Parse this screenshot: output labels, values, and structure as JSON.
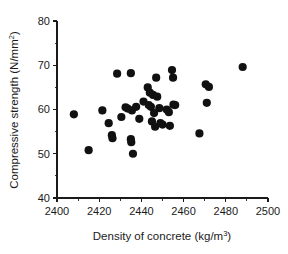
{
  "chart_data": {
    "type": "scatter",
    "title": "",
    "xlabel": "Density of concrete (kg/m3)",
    "xlabel_base": "Density of concrete (kg/m",
    "xlabel_sup": "3",
    "xlabel_tail": ")",
    "ylabel": "Compressive strength (N/mm2)",
    "ylabel_base": "Compressive strength (N/mm",
    "ylabel_sup": "2",
    "ylabel_tail": ")",
    "xlim": [
      2400,
      2500
    ],
    "ylim": [
      40,
      80
    ],
    "x_major_ticks": [
      2400,
      2420,
      2440,
      2460,
      2480,
      2500
    ],
    "x_minor_ticks": [
      2410,
      2430,
      2450,
      2470,
      2490
    ],
    "y_major_ticks": [
      40,
      50,
      60,
      70,
      80
    ],
    "y_minor_ticks": [
      45,
      55,
      65,
      75
    ],
    "x_tick_labels": [
      "2400",
      "2420",
      "2440",
      "2460",
      "2480",
      "2500"
    ],
    "y_tick_labels": [
      "40",
      "50",
      "60",
      "70",
      "80"
    ],
    "grid": false,
    "legend": false,
    "marker": "filled-circle",
    "marker_color": "#111111",
    "marker_size": 4.1,
    "points": [
      {
        "x": 2408.0,
        "y": 58.9
      },
      {
        "x": 2415.0,
        "y": 50.8
      },
      {
        "x": 2421.5,
        "y": 59.8
      },
      {
        "x": 2424.5,
        "y": 56.9
      },
      {
        "x": 2426.0,
        "y": 54.2
      },
      {
        "x": 2426.3,
        "y": 53.5
      },
      {
        "x": 2428.5,
        "y": 68.1
      },
      {
        "x": 2430.5,
        "y": 58.3
      },
      {
        "x": 2432.5,
        "y": 60.5
      },
      {
        "x": 2433.5,
        "y": 60.2
      },
      {
        "x": 2435.0,
        "y": 68.2
      },
      {
        "x": 2435.0,
        "y": 53.3
      },
      {
        "x": 2435.2,
        "y": 52.6
      },
      {
        "x": 2435.5,
        "y": 59.8
      },
      {
        "x": 2436.0,
        "y": 50.0
      },
      {
        "x": 2437.5,
        "y": 60.6
      },
      {
        "x": 2439.0,
        "y": 57.9
      },
      {
        "x": 2441.0,
        "y": 61.8
      },
      {
        "x": 2443.0,
        "y": 65.0
      },
      {
        "x": 2443.5,
        "y": 61.0
      },
      {
        "x": 2444.0,
        "y": 63.8
      },
      {
        "x": 2444.5,
        "y": 60.6
      },
      {
        "x": 2445.0,
        "y": 57.3
      },
      {
        "x": 2445.5,
        "y": 63.3
      },
      {
        "x": 2446.0,
        "y": 59.2
      },
      {
        "x": 2446.5,
        "y": 56.1
      },
      {
        "x": 2447.0,
        "y": 67.2
      },
      {
        "x": 2447.5,
        "y": 62.9
      },
      {
        "x": 2448.5,
        "y": 60.3
      },
      {
        "x": 2449.0,
        "y": 56.9
      },
      {
        "x": 2450.0,
        "y": 56.6
      },
      {
        "x": 2452.0,
        "y": 60.0
      },
      {
        "x": 2453.0,
        "y": 59.4
      },
      {
        "x": 2453.5,
        "y": 56.3
      },
      {
        "x": 2454.5,
        "y": 68.9
      },
      {
        "x": 2455.0,
        "y": 67.2
      },
      {
        "x": 2455.2,
        "y": 61.1
      },
      {
        "x": 2456.0,
        "y": 61.0
      },
      {
        "x": 2467.5,
        "y": 54.6
      },
      {
        "x": 2470.5,
        "y": 65.7
      },
      {
        "x": 2472.0,
        "y": 65.1
      },
      {
        "x": 2471.0,
        "y": 61.5
      },
      {
        "x": 2488.0,
        "y": 69.6
      }
    ]
  }
}
